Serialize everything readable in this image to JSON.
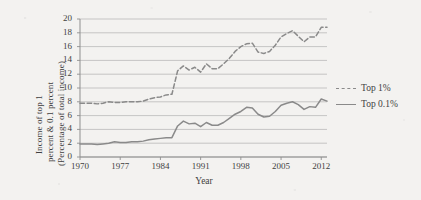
{
  "figure": {
    "background_color": "#f3f2f0",
    "line_color": "#8a8a8a",
    "grid_color": "#b9b9b9",
    "axis_color": "#8f8f8f"
  },
  "axis_titles": {
    "y_line1": "Income of top 1",
    "y_line2": "percent &  0.1 percent",
    "y_line3": "(Percentage of total income)",
    "x": "Year"
  },
  "legend": {
    "position": "right",
    "items": [
      {
        "label": "Top 1%",
        "style": "dashed",
        "key_name": "legend-key-top-1"
      },
      {
        "label": "Top 0.1%",
        "style": "solid",
        "key_name": "legend-key-top-01"
      }
    ]
  },
  "chart_data": {
    "type": "line",
    "title": "",
    "xlabel": "Year",
    "ylabel": "Income of top 1 percent &  0.1 percent (Percentage of total income)",
    "xlim": [
      1970,
      2013
    ],
    "ylim": [
      0,
      20
    ],
    "ytick_labels": [
      "0",
      "2",
      "4",
      "6",
      "8",
      "10",
      "12",
      "14",
      "16",
      "18",
      "20"
    ],
    "yticks": [
      0,
      2,
      4,
      6,
      8,
      10,
      12,
      14,
      16,
      18,
      20
    ],
    "xtick_labels": [
      "1970",
      "1977",
      "1984",
      "1991",
      "1998",
      "2005",
      "2012"
    ],
    "xticks": [
      1970,
      1977,
      1984,
      1991,
      1998,
      2005,
      2012
    ],
    "grid": "horizontal",
    "legend_position": "right",
    "x": [
      1970,
      1971,
      1972,
      1973,
      1974,
      1975,
      1976,
      1977,
      1978,
      1979,
      1980,
      1981,
      1982,
      1983,
      1984,
      1985,
      1986,
      1987,
      1988,
      1989,
      1990,
      1991,
      1992,
      1993,
      1994,
      1995,
      1996,
      1997,
      1998,
      1999,
      2000,
      2001,
      2002,
      2003,
      2004,
      2005,
      2006,
      2007,
      2008,
      2009,
      2010,
      2011,
      2012,
      2013
    ],
    "series": [
      {
        "name": "Top 1%",
        "style": "dashed",
        "color": "#8a8a8a",
        "values": [
          7.8,
          7.8,
          7.8,
          7.7,
          7.8,
          8.0,
          7.9,
          7.9,
          8.0,
          8.0,
          8.0,
          8.1,
          8.4,
          8.6,
          8.7,
          9.0,
          9.1,
          12.5,
          13.2,
          12.6,
          13.0,
          12.3,
          13.5,
          12.8,
          12.8,
          13.5,
          14.3,
          15.3,
          16.0,
          16.4,
          16.5,
          15.2,
          15.0,
          15.3,
          16.2,
          17.4,
          17.9,
          18.3,
          17.5,
          16.7,
          17.4,
          17.4,
          18.8,
          18.8
        ]
      },
      {
        "name": "Top 0.1%",
        "style": "solid",
        "color": "#8a8a8a",
        "values": [
          1.9,
          1.9,
          1.9,
          1.8,
          1.9,
          2.0,
          2.2,
          2.1,
          2.1,
          2.2,
          2.2,
          2.3,
          2.5,
          2.6,
          2.7,
          2.8,
          2.8,
          4.5,
          5.2,
          4.8,
          4.9,
          4.4,
          5.0,
          4.6,
          4.6,
          5.0,
          5.6,
          6.2,
          6.6,
          7.2,
          7.1,
          6.2,
          5.8,
          5.9,
          6.6,
          7.5,
          7.8,
          8.0,
          7.6,
          6.9,
          7.3,
          7.2,
          8.4,
          8.1
        ]
      }
    ]
  }
}
